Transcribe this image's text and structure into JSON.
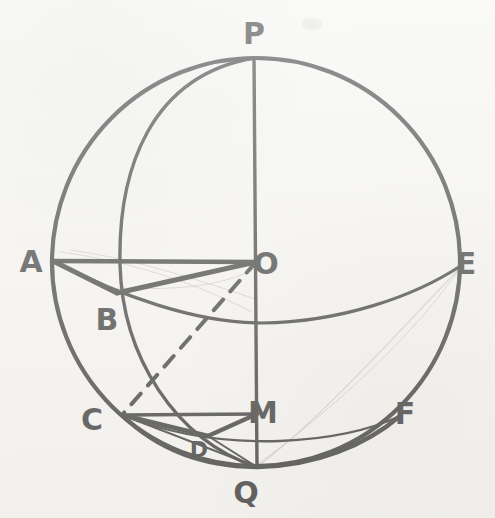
{
  "figure": {
    "kind": "hand-drawn-geometry-diagram",
    "background_color": "#f4f3f0",
    "ink_color": "#151515",
    "faint_pencil_color": "#b9b7b4",
    "canvas": {
      "width": 495,
      "height": 518
    }
  },
  "outline": {
    "name": "sphere-outline-circle",
    "center": {
      "x": 256,
      "y": 262
    },
    "radius": 204,
    "stroke_width": 4.2
  },
  "labels": [
    {
      "id": "P",
      "text": "P",
      "x": 254,
      "y": 44,
      "font_size": 30
    },
    {
      "id": "A",
      "text": "A",
      "x": 31,
      "y": 272,
      "font_size": 30
    },
    {
      "id": "O",
      "text": "O",
      "x": 266,
      "y": 274,
      "font_size": 30
    },
    {
      "id": "E",
      "text": "E",
      "x": 466,
      "y": 274,
      "font_size": 30
    },
    {
      "id": "B",
      "text": "B",
      "x": 107,
      "y": 330,
      "font_size": 30
    },
    {
      "id": "C",
      "text": "C",
      "x": 92,
      "y": 430,
      "font_size": 30
    },
    {
      "id": "M",
      "text": "M",
      "x": 263,
      "y": 423,
      "font_size": 30
    },
    {
      "id": "F",
      "text": "F",
      "x": 405,
      "y": 424,
      "font_size": 30
    },
    {
      "id": "D",
      "text": "D",
      "x": 199,
      "y": 457,
      "font_size": 22
    },
    {
      "id": "Q",
      "text": "Q",
      "x": 246,
      "y": 503,
      "font_size": 30
    }
  ],
  "points": {
    "P": {
      "x": 254,
      "y": 58
    },
    "A": {
      "x": 53,
      "y": 261
    },
    "O": {
      "x": 256,
      "y": 262
    },
    "E": {
      "x": 462,
      "y": 265
    },
    "B": {
      "x": 117,
      "y": 293
    },
    "C": {
      "x": 122,
      "y": 415
    },
    "M": {
      "x": 257,
      "y": 414
    },
    "F": {
      "x": 400,
      "y": 416
    },
    "D": {
      "x": 208,
      "y": 436
    },
    "Q": {
      "x": 257,
      "y": 467
    }
  },
  "segments": [
    {
      "name": "axis-P-Q",
      "from": "P",
      "to": "Q",
      "style": "solid",
      "width": 3.4
    },
    {
      "name": "radius-A-O",
      "from": "A",
      "to": "O",
      "style": "solid",
      "width": 4.6
    },
    {
      "name": "chord-A-B",
      "from": "A",
      "to": "B",
      "style": "solid",
      "width": 5.0
    },
    {
      "name": "chord-B-O",
      "from": "B",
      "to": "O",
      "style": "solid",
      "width": 5.0
    },
    {
      "name": "segment-C-M",
      "from": "C",
      "to": "M",
      "style": "solid",
      "width": 3.6
    },
    {
      "name": "chord-C-D",
      "from": "C",
      "to": "D",
      "style": "solid",
      "width": 4.4
    },
    {
      "name": "chord-D-M",
      "from": "D",
      "to": "M",
      "style": "solid",
      "width": 4.4
    },
    {
      "name": "chord-C-Q",
      "from": "C",
      "to": "Q",
      "style": "solid",
      "width": 2.0
    },
    {
      "name": "chord-D-Q",
      "from": "D",
      "to": "Q",
      "style": "solid",
      "width": 2.0
    },
    {
      "name": "dashed-O-C",
      "from": "O",
      "to": "C",
      "style": "dashed",
      "width": 4.0,
      "dash": "14 11"
    }
  ],
  "arcs": [
    {
      "name": "meridian-ellipse-P-Q",
      "description": "great circle meridian bulging to the left from P through x=122 to Q",
      "path": "M 254 58 C 150 76 118 170 120 264 C 122 356 175 440 257 467",
      "width": 3.4
    },
    {
      "name": "equator-ellipse-A-E",
      "description": "equator ellipse sagging from A through B and below O up to E",
      "path": "M 53 261 C 120 296 196 323 262 323 C 340 322 414 297 462 265",
      "width": 3.2
    },
    {
      "name": "small-circle-C-F-upper",
      "description": "upper small-circle arc from C through D to F",
      "path": "M 122 415 C 170 434 220 443 280 441 C 330 439 370 430 400 416",
      "width": 2.4
    },
    {
      "name": "small-circle-Q-F-lower",
      "description": "lower small-circle arc from C through Q to F",
      "path": "M 122 415 C 160 452 206 467 258 467 C 316 466 366 445 400 416",
      "width": 4.4
    },
    {
      "name": "faint-pencil-E-Q",
      "description": "faint pencil arc from E down to Q",
      "path": "M 460 268 C 400 330 320 420 258 466",
      "width": 1.2,
      "faint": true
    },
    {
      "name": "faint-pencil-E-Q-2",
      "description": "second faint pencil arc inside E to Q",
      "path": "M 461 266 C 420 330 330 412 258 464",
      "width": 1.0,
      "faint": true
    },
    {
      "name": "faint-pencil-A-O-1",
      "description": "faint construction strokes near A and O",
      "path": "M 70 250 C 130 258 200 280 258 300",
      "width": 1.0,
      "faint": true
    },
    {
      "name": "faint-pencil-A-O-2",
      "description": "faint construction stroke fanning from O",
      "path": "M 60 252 C 140 262 210 290 252 312",
      "width": 1.0,
      "faint": true
    },
    {
      "name": "faint-pencil-B-O",
      "description": "faint construction stroke from B toward O",
      "path": "M 118 288 C 170 290 220 288 256 268",
      "width": 1.0,
      "faint": true
    }
  ],
  "smudge": {
    "name": "paper-smudge",
    "x": 312,
    "y": 24,
    "rx": 11,
    "ry": 6
  }
}
